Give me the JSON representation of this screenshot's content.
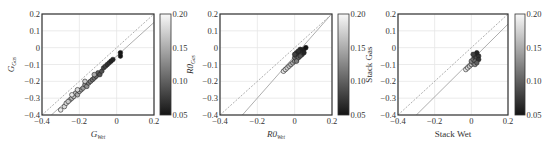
{
  "chart_data": [
    {
      "type": "scatter",
      "title": "",
      "xlabel": "G_Wet",
      "xlabel_main": "G",
      "xlabel_sub": "Wet",
      "ylabel": "G_Gas",
      "ylabel_main": "G",
      "ylabel_sub": "Gas",
      "xlim": [
        -0.4,
        0.2
      ],
      "ylim": [
        -0.4,
        0.2
      ],
      "xticks": [
        "-0.4",
        "-0.2",
        "0",
        "0.2"
      ],
      "yticks": [
        "0.2",
        "0.1",
        "0",
        "-0.1",
        "-0.2",
        "-0.3",
        "-0.4"
      ],
      "grid": true,
      "reference_lines": [
        {
          "style": "dashed",
          "points": [
            [
              -0.4,
              -0.4
            ],
            [
              0.2,
              0.2
            ]
          ]
        },
        {
          "style": "solid",
          "points": [
            [
              -0.35,
              -0.4
            ],
            [
              0.2,
              0.15
            ]
          ]
        }
      ],
      "colorbar": {
        "min": 0.05,
        "max": 0.2,
        "ticks": [
          "0.20",
          "0.15",
          "0.10",
          "0.05"
        ],
        "label": ""
      },
      "points": [
        [
          -0.3,
          -0.37,
          0.19
        ],
        [
          -0.28,
          -0.35,
          0.18
        ],
        [
          -0.27,
          -0.33,
          0.18
        ],
        [
          -0.25,
          -0.31,
          0.17
        ],
        [
          -0.26,
          -0.32,
          0.17
        ],
        [
          -0.24,
          -0.3,
          0.16
        ],
        [
          -0.23,
          -0.29,
          0.16
        ],
        [
          -0.22,
          -0.27,
          0.16
        ],
        [
          -0.21,
          -0.28,
          0.15
        ],
        [
          -0.2,
          -0.26,
          0.15
        ],
        [
          -0.19,
          -0.25,
          0.14
        ],
        [
          -0.18,
          -0.24,
          0.14
        ],
        [
          -0.17,
          -0.22,
          0.13
        ],
        [
          -0.16,
          -0.23,
          0.13
        ],
        [
          -0.15,
          -0.21,
          0.12
        ],
        [
          -0.14,
          -0.2,
          0.12
        ],
        [
          -0.13,
          -0.19,
          0.11
        ],
        [
          -0.12,
          -0.18,
          0.11
        ],
        [
          -0.11,
          -0.17,
          0.1
        ],
        [
          -0.1,
          -0.15,
          0.1
        ],
        [
          -0.09,
          -0.16,
          0.09
        ],
        [
          -0.08,
          -0.14,
          0.09
        ],
        [
          -0.07,
          -0.12,
          0.08
        ],
        [
          -0.06,
          -0.11,
          0.08
        ],
        [
          -0.05,
          -0.1,
          0.07
        ],
        [
          -0.04,
          -0.09,
          0.07
        ],
        [
          -0.03,
          -0.08,
          0.06
        ],
        [
          -0.02,
          -0.07,
          0.06
        ],
        [
          0.02,
          -0.03,
          0.05
        ],
        [
          0.02,
          -0.05,
          0.05
        ],
        [
          -0.17,
          -0.2,
          0.17
        ],
        [
          -0.21,
          -0.25,
          0.18
        ],
        [
          -0.12,
          -0.16,
          0.15
        ],
        [
          -0.24,
          -0.28,
          0.19
        ]
      ]
    },
    {
      "type": "scatter",
      "title": "",
      "xlabel": "R0_Wet",
      "xlabel_main": "R0",
      "xlabel_sub": "Wet",
      "ylabel": "R0_Gas",
      "ylabel_main": "R0",
      "ylabel_sub": "Gas",
      "xlim": [
        -0.4,
        0.2
      ],
      "ylim": [
        -0.4,
        0.2
      ],
      "xticks": [
        "-0.4",
        "-0.2",
        "0",
        "0.2"
      ],
      "yticks": [
        "0.2",
        "0.1",
        "0",
        "-0.1",
        "-0.2",
        "-0.3",
        "-0.4"
      ],
      "grid": true,
      "reference_lines": [
        {
          "style": "dashed",
          "points": [
            [
              -0.4,
              -0.4
            ],
            [
              0.2,
              0.2
            ]
          ]
        },
        {
          "style": "solid",
          "points": [
            [
              -0.28,
              -0.4
            ],
            [
              0.19,
              0.19
            ]
          ]
        }
      ],
      "colorbar": {
        "min": 0.05,
        "max": 0.2,
        "ticks": [
          "0.20",
          "0.15",
          "0.10",
          "0.05"
        ],
        "label": ""
      },
      "points": [
        [
          -0.06,
          -0.14,
          0.19
        ],
        [
          -0.05,
          -0.13,
          0.18
        ],
        [
          -0.04,
          -0.12,
          0.18
        ],
        [
          -0.03,
          -0.11,
          0.17
        ],
        [
          -0.02,
          -0.1,
          0.16
        ],
        [
          -0.01,
          -0.09,
          0.15
        ],
        [
          0.0,
          -0.08,
          0.14
        ],
        [
          0.01,
          -0.07,
          0.12
        ],
        [
          0.0,
          -0.06,
          0.11
        ],
        [
          0.01,
          -0.05,
          0.1
        ],
        [
          0.02,
          -0.04,
          0.09
        ],
        [
          0.03,
          -0.03,
          0.08
        ],
        [
          0.04,
          -0.02,
          0.07
        ],
        [
          0.05,
          -0.01,
          0.06
        ],
        [
          0.04,
          -0.04,
          0.08
        ],
        [
          0.02,
          -0.06,
          0.1
        ],
        [
          0.03,
          -0.05,
          0.09
        ],
        [
          0.01,
          -0.03,
          0.07
        ],
        [
          0.0,
          -0.04,
          0.08
        ],
        [
          0.05,
          -0.03,
          0.06
        ],
        [
          0.06,
          0.0,
          0.05
        ],
        [
          0.03,
          -0.01,
          0.06
        ],
        [
          0.02,
          -0.02,
          0.07
        ],
        [
          0.01,
          -0.08,
          0.12
        ]
      ]
    },
    {
      "type": "scatter",
      "title": "",
      "xlabel": "Stack Wet",
      "ylabel": "Stack Gas",
      "xlim": [
        -0.4,
        0.2
      ],
      "ylim": [
        -0.4,
        0.2
      ],
      "xticks": [
        "-0.4",
        "-0.2",
        "0",
        "0.2"
      ],
      "yticks": [
        "0.2",
        "0.1",
        "0",
        "-0.1",
        "-0.2",
        "-0.3",
        "-0.4"
      ],
      "grid": true,
      "reference_lines": [
        {
          "style": "dashed",
          "points": [
            [
              -0.4,
              -0.4
            ],
            [
              0.2,
              0.2
            ]
          ]
        },
        {
          "style": "solid",
          "points": [
            [
              -0.3,
              -0.4
            ],
            [
              0.2,
              0.14
            ]
          ]
        }
      ],
      "colorbar": {
        "min": 0.05,
        "max": 0.2,
        "ticks": [
          "0.20",
          "0.15",
          "0.10",
          "0.05"
        ],
        "label": "Stack Gas"
      },
      "points": [
        [
          -0.03,
          -0.13,
          0.19
        ],
        [
          -0.02,
          -0.12,
          0.18
        ],
        [
          -0.01,
          -0.11,
          0.17
        ],
        [
          0.0,
          -0.1,
          0.16
        ],
        [
          0.01,
          -0.09,
          0.14
        ],
        [
          0.0,
          -0.08,
          0.13
        ],
        [
          0.01,
          -0.07,
          0.12
        ],
        [
          0.02,
          -0.06,
          0.1
        ],
        [
          0.02,
          -0.05,
          0.09
        ],
        [
          0.03,
          -0.04,
          0.08
        ],
        [
          0.03,
          -0.06,
          0.09
        ],
        [
          0.04,
          -0.05,
          0.07
        ],
        [
          0.02,
          -0.08,
          0.11
        ],
        [
          0.03,
          -0.03,
          0.06
        ],
        [
          0.01,
          -0.04,
          0.08
        ],
        [
          0.04,
          -0.07,
          0.07
        ],
        [
          0.02,
          -0.1,
          0.13
        ],
        [
          0.03,
          -0.09,
          0.1
        ]
      ]
    }
  ],
  "panels": [
    {
      "xlabel_main": "G",
      "xlabel_sub": "Wet",
      "ylabel_main": "G",
      "ylabel_sub": "Gas"
    },
    {
      "xlabel_main": "R0",
      "xlabel_sub": "Wet",
      "ylabel_main": "R0",
      "ylabel_sub": "Gas"
    },
    {
      "xlabel_main": "Stack Wet",
      "xlabel_sub": "",
      "ylabel_main": "Stack Gas",
      "ylabel_sub": ""
    }
  ],
  "colors": {
    "frame": "#333333",
    "grid": "#e6e6e6",
    "reference_line": "#999999",
    "marker_edge": "#222222"
  }
}
